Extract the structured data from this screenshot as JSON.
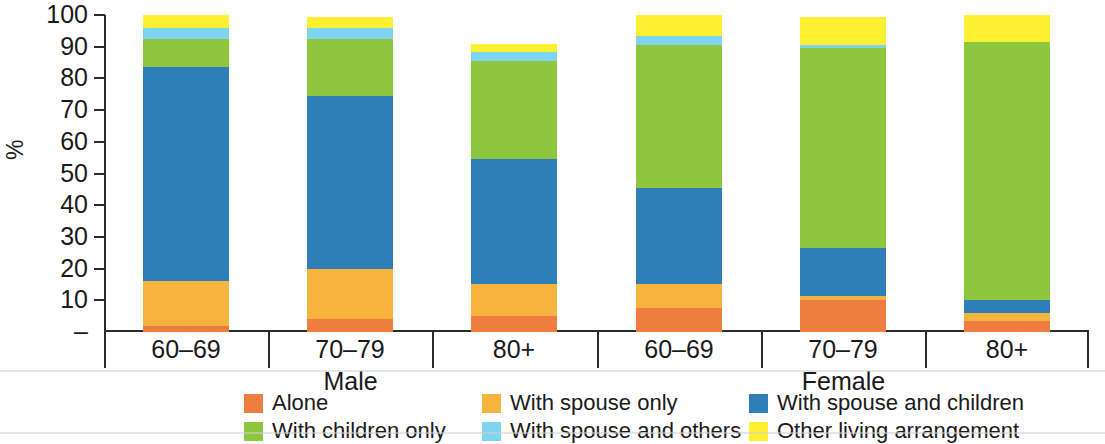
{
  "chart_data": {
    "type": "bar",
    "title": "",
    "subtitle": "",
    "xlabel": "",
    "ylabel": "%",
    "ylim": [
      0,
      100
    ],
    "grid": false,
    "stacked": true,
    "stack_total": 100,
    "legend_position": "bottom",
    "tick_labels": [
      "100",
      "90",
      "80",
      "70",
      "60",
      "50",
      "40",
      "30",
      "20",
      "10",
      "–"
    ],
    "tick_values": [
      100,
      90,
      80,
      70,
      60,
      50,
      40,
      30,
      20,
      10,
      0
    ],
    "groups": [
      {
        "label": "Male",
        "categories": [
          "60–69",
          "70–79",
          "80+"
        ]
      },
      {
        "label": "Female",
        "categories": [
          "60–69",
          "70–79",
          "80+"
        ]
      }
    ],
    "categories": [
      "60–69",
      "70–79",
      "80+",
      "60–69",
      "70–79",
      "80+"
    ],
    "series": [
      {
        "name": "Alone",
        "color": "#ef7d3f",
        "values": [
          2,
          4,
          5,
          7.5,
          10,
          3.5
        ]
      },
      {
        "name": "With spouse only",
        "color": "#f6b33d",
        "values": [
          14,
          16,
          10,
          7.5,
          1.5,
          2.5
        ]
      },
      {
        "name": "With spouse and children",
        "color": "#2e7fb8",
        "values": [
          67.5,
          54.5,
          39.5,
          30.5,
          15,
          4
        ]
      },
      {
        "name": "With children only",
        "color": "#8dc63f",
        "values": [
          9,
          18,
          31,
          45,
          63,
          81.5
        ]
      },
      {
        "name": "With spouse and others",
        "color": "#7fd4f0",
        "values": [
          3.5,
          3.5,
          3,
          3,
          1,
          0
        ]
      },
      {
        "name": "Other living arrangement",
        "color": "#fdf030",
        "values": [
          4,
          3.5,
          2.5,
          6.5,
          9,
          8.5
        ]
      }
    ],
    "legend": [
      {
        "label": "Alone",
        "color": "#ef7d3f"
      },
      {
        "label": "With spouse only",
        "color": "#f6b33d"
      },
      {
        "label": "With spouse and children",
        "color": "#2e7fb8"
      },
      {
        "label": "With children only",
        "color": "#8dc63f"
      },
      {
        "label": "With spouse and others",
        "color": "#7fd4f0"
      },
      {
        "label": "Other living arrangement",
        "color": "#fdf030"
      }
    ]
  }
}
